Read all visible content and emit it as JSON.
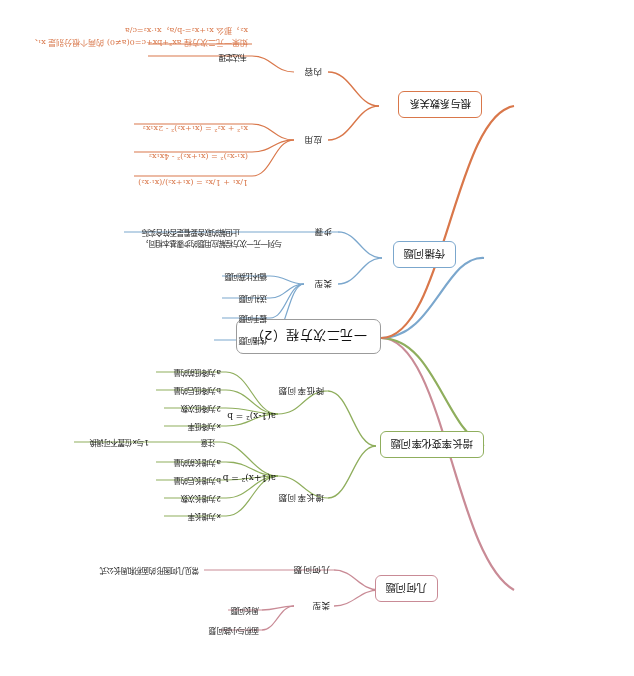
{
  "root": {
    "label": "一元二次方程（2）"
  },
  "branches": [
    {
      "id": "geometry",
      "label": "几何问题",
      "color": "#c98b96",
      "children": [
        {
          "label": "类型",
          "children": [
            {
              "label": "面积与小路问题"
            },
            {
              "label": "周长问题"
            }
          ]
        },
        {
          "label": "几何问题",
          "children": []
        }
      ],
      "note": "常见几何图形的面积和周长公式"
    },
    {
      "id": "growth",
      "label": "增长率变化率问题",
      "color": "#8fae5d",
      "children": [
        {
          "label": "增长率问题",
          "formula": "a(1+x)² = b",
          "leaves": [
            "x为增长率",
            "2为增长次数",
            "b为增长后的量",
            "a为增长前的量"
          ]
        },
        {
          "label": "降低率问题",
          "formula": "a(1-x)² = b",
          "leaves": [
            "x为降低率",
            "2为降低次数",
            "b为降低后的量",
            "a为降低前的量"
          ],
          "tip_label": "注意",
          "tip": "1与x位置不可调换"
        }
      ]
    },
    {
      "id": "spread",
      "label": "传播问题",
      "color": "#7ba7cd",
      "children": [
        {
          "label": "类型",
          "children": [
            {
              "label": "传播问题"
            },
            {
              "label": "握手问题"
            },
            {
              "label": "送礼问题"
            },
            {
              "label": "循环比赛问题"
            }
          ]
        },
        {
          "label": "步骤",
          "note": "与列一元一次方程解应用题的步骤基本相同，\n止但解的取舍要看是否符合实际"
        }
      ]
    },
    {
      "id": "roots",
      "label": "根与系数关系",
      "color": "#d9774a",
      "children": [
        {
          "label": "应用",
          "formulas": [
            "1/x₁ + 1/x₂ = (x₁+x₂)/(x₁·x₂)",
            "(x₁-x₂)² = (x₁+x₂)² - 4x₁x₂",
            "x₁² + x₂² = (x₁+x₂)² - 2x₁x₂"
          ]
        },
        {
          "label": "内容",
          "sub_label": "韦达定理",
          "text": "如果一元二次方程 ax²+bx+c=0(a≠0) 的两个根分别是 x₁、x₂，那么 x₁+x₂=-b/a，x₁·x₂=c/a"
        }
      ]
    }
  ]
}
